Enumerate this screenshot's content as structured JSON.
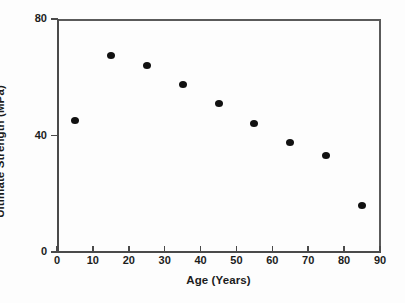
{
  "chart_data": {
    "type": "scatter",
    "title": "",
    "xlabel": "Age (Years)",
    "ylabel": "Ultimate Strength (MPa)",
    "xlim": [
      0,
      90
    ],
    "ylim": [
      0,
      80
    ],
    "xticks": [
      0,
      10,
      20,
      30,
      40,
      50,
      60,
      70,
      80,
      90
    ],
    "xticklabels": [
      "0",
      "10",
      "20",
      "30",
      "40",
      "50",
      "60",
      "70",
      "80",
      "90"
    ],
    "yticks": [
      0,
      40,
      80
    ],
    "yticklabels": [
      "0",
      "40",
      "80"
    ],
    "grid": false,
    "legend": null,
    "marker": "filled-circle",
    "marker_color": "#111111",
    "axis_color": "#4a4a4a",
    "background_color": "#fdfdfd",
    "x": [
      5,
      15,
      25,
      35,
      45,
      55,
      65,
      75,
      85
    ],
    "y": [
      45,
      67.5,
      64,
      57.5,
      51,
      44,
      37.5,
      33,
      16
    ],
    "points": [
      {
        "x": 5,
        "y": 45
      },
      {
        "x": 15,
        "y": 67.5
      },
      {
        "x": 25,
        "y": 64
      },
      {
        "x": 35,
        "y": 57.5
      },
      {
        "x": 45,
        "y": 51
      },
      {
        "x": 55,
        "y": 44
      },
      {
        "x": 65,
        "y": 37.5
      },
      {
        "x": 75,
        "y": 33
      },
      {
        "x": 85,
        "y": 16
      }
    ]
  }
}
